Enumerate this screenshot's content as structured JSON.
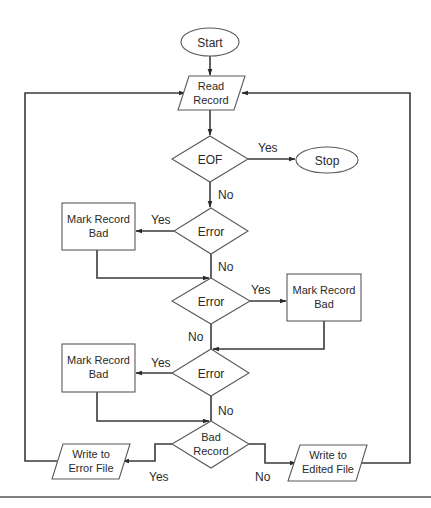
{
  "diagram": {
    "type": "flowchart",
    "colors": {
      "stroke": "#5a5a5a",
      "flow": "#3a3a3a",
      "text": "#2a2a2a",
      "background": "#ffffff"
    },
    "nodes": {
      "start": {
        "shape": "terminator",
        "label": "Start"
      },
      "read_record": {
        "shape": "input-output",
        "line1": "Read",
        "line2": "Record"
      },
      "eof": {
        "shape": "decision",
        "label": "EOF"
      },
      "stop": {
        "shape": "terminator",
        "label": "Stop"
      },
      "error1": {
        "shape": "decision",
        "label": "Error"
      },
      "mark_bad1": {
        "shape": "process",
        "line1": "Mark Record",
        "line2": "Bad"
      },
      "error2": {
        "shape": "decision",
        "label": "Error"
      },
      "mark_bad2": {
        "shape": "process",
        "line1": "Mark Record",
        "line2": "Bad"
      },
      "error3": {
        "shape": "decision",
        "label": "Error"
      },
      "mark_bad3": {
        "shape": "process",
        "line1": "Mark Record",
        "line2": "Bad"
      },
      "bad_record": {
        "shape": "decision",
        "line1": "Bad",
        "line2": "Record"
      },
      "write_error": {
        "shape": "input-output",
        "line1": "Write to",
        "line2": "Error File"
      },
      "write_edited": {
        "shape": "input-output",
        "line1": "Write to",
        "line2": "Edited File"
      }
    },
    "edge_labels": {
      "eof_yes": "Yes",
      "eof_no": "No",
      "error1_yes": "Yes",
      "error1_no": "No",
      "error2_yes": "Yes",
      "error2_no": "No",
      "error3_yes": "Yes",
      "error3_no": "No",
      "bad_yes": "Yes",
      "bad_no": "No"
    },
    "edges": [
      {
        "from": "start",
        "to": "read_record"
      },
      {
        "from": "read_record",
        "to": "eof"
      },
      {
        "from": "eof",
        "to": "stop",
        "label": "Yes"
      },
      {
        "from": "eof",
        "to": "error1",
        "label": "No"
      },
      {
        "from": "error1",
        "to": "mark_bad1",
        "label": "Yes"
      },
      {
        "from": "error1",
        "to": "error2",
        "label": "No"
      },
      {
        "from": "mark_bad1",
        "to": "error2"
      },
      {
        "from": "error2",
        "to": "mark_bad2",
        "label": "Yes"
      },
      {
        "from": "error2",
        "to": "error3",
        "label": "No"
      },
      {
        "from": "mark_bad2",
        "to": "error3"
      },
      {
        "from": "error3",
        "to": "mark_bad3",
        "label": "Yes"
      },
      {
        "from": "error3",
        "to": "bad_record",
        "label": "No"
      },
      {
        "from": "mark_bad3",
        "to": "bad_record"
      },
      {
        "from": "bad_record",
        "to": "write_error",
        "label": "Yes"
      },
      {
        "from": "bad_record",
        "to": "write_edited",
        "label": "No"
      },
      {
        "from": "write_error",
        "to": "read_record"
      },
      {
        "from": "write_edited",
        "to": "read_record"
      }
    ]
  }
}
